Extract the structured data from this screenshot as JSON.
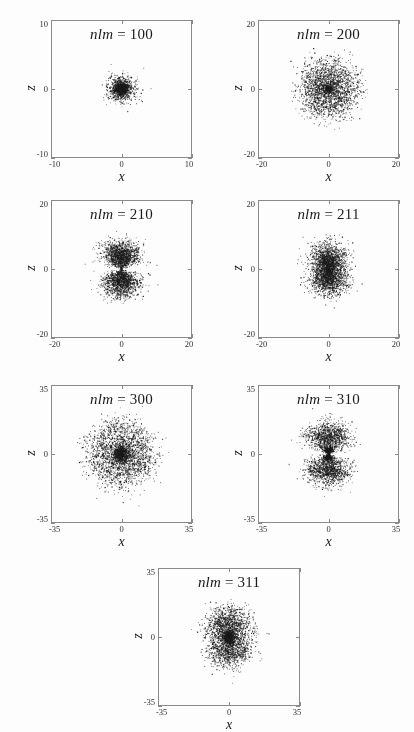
{
  "figure": {
    "background_color": "#fdfdfd",
    "frame_color": "#8a8a8a",
    "point_color": "#1a1a1a",
    "axis_label_x": "x",
    "axis_label_z": "z"
  },
  "chart_data": {
    "type": "scatter",
    "title": "",
    "xlabel": "x",
    "ylabel": "z",
    "grid": false,
    "legend": null,
    "panels": [
      {
        "id": "panel-100",
        "title_var": "nlm",
        "title_eq": "=",
        "title_value": "100",
        "title": "nlm = 100",
        "xlabel": "x",
        "ylabel": "z",
        "xlim": [
          -10,
          10
        ],
        "ylim": [
          -10,
          10
        ],
        "xticks": [
          -10,
          0,
          10
        ],
        "yticks": [
          -10,
          0,
          10
        ],
        "xtick_labels": [
          "-10",
          "0",
          "10"
        ],
        "ytick_labels": [
          "-10",
          "0",
          "10"
        ],
        "n_points": 2600,
        "shape": "sphere",
        "shells": [
          {
            "radius": 0.0,
            "spread": 1.35,
            "weight": 1.0
          }
        ],
        "lobe_axis": "none",
        "lobe_power": 0
      },
      {
        "id": "panel-200",
        "title_var": "nlm",
        "title_eq": "=",
        "title_value": "200",
        "title": "nlm = 200",
        "xlabel": "x",
        "ylabel": "z",
        "xlim": [
          -20,
          20
        ],
        "ylim": [
          -20,
          20
        ],
        "xticks": [
          -20,
          0,
          20
        ],
        "yticks": [
          -20,
          0,
          20
        ],
        "xtick_labels": [
          "-20",
          "0",
          "20"
        ],
        "ytick_labels": [
          "-20",
          "0",
          "20"
        ],
        "n_points": 2900,
        "shape": "sphere",
        "shells": [
          {
            "radius": 0.0,
            "spread": 1.1,
            "weight": 0.22
          },
          {
            "radius": 6.4,
            "spread": 2.5,
            "weight": 0.78
          }
        ],
        "lobe_axis": "none",
        "lobe_power": 0
      },
      {
        "id": "panel-210",
        "title_var": "nlm",
        "title_eq": "=",
        "title_value": "210",
        "title": "nlm = 210",
        "xlabel": "x",
        "ylabel": "z",
        "xlim": [
          -20,
          20
        ],
        "ylim": [
          -20,
          20
        ],
        "xticks": [
          -20,
          0,
          20
        ],
        "yticks": [
          -20,
          0,
          20
        ],
        "xtick_labels": [
          "-20",
          "0",
          "20"
        ],
        "ytick_labels": [
          "-20",
          "0",
          "20"
        ],
        "n_points": 2900,
        "shape": "lobes",
        "shells": [
          {
            "radius": 5.2,
            "spread": 2.1,
            "weight": 1.0
          }
        ],
        "lobe_axis": "z",
        "lobe_power": 2
      },
      {
        "id": "panel-211",
        "title_var": "nlm",
        "title_eq": "=",
        "title_value": "211",
        "title": "nlm = 211",
        "xlabel": "x",
        "ylabel": "z",
        "xlim": [
          -20,
          20
        ],
        "ylim": [
          -20,
          20
        ],
        "xticks": [
          -20,
          0,
          20
        ],
        "yticks": [
          -20,
          0,
          20
        ],
        "xtick_labels": [
          "-20",
          "0",
          "20"
        ],
        "ytick_labels": [
          "-20",
          "0",
          "20"
        ],
        "n_points": 2900,
        "shape": "lobes",
        "shells": [
          {
            "radius": 5.2,
            "spread": 2.1,
            "weight": 1.0
          }
        ],
        "lobe_axis": "x",
        "lobe_power": 2
      },
      {
        "id": "panel-300",
        "title_var": "nlm",
        "title_eq": "=",
        "title_value": "300",
        "title": "nlm = 300",
        "xlabel": "x",
        "ylabel": "z",
        "xlim": [
          -35,
          35
        ],
        "ylim": [
          -35,
          35
        ],
        "xticks": [
          -35,
          0,
          35
        ],
        "yticks": [
          -35,
          0,
          35
        ],
        "xtick_labels": [
          "-35",
          "0",
          "35"
        ],
        "ytick_labels": [
          "-35",
          "0",
          "35"
        ],
        "n_points": 3100,
        "shape": "sphere",
        "shells": [
          {
            "radius": 0.0,
            "spread": 1.0,
            "weight": 0.06
          },
          {
            "radius": 3.6,
            "spread": 1.2,
            "weight": 0.24
          },
          {
            "radius": 13.5,
            "spread": 4.2,
            "weight": 0.7
          }
        ],
        "lobe_axis": "none",
        "lobe_power": 0
      },
      {
        "id": "panel-310",
        "title_var": "nlm",
        "title_eq": "=",
        "title_value": "310",
        "title": "nlm = 310",
        "xlabel": "x",
        "ylabel": "z",
        "xlim": [
          -35,
          35
        ],
        "ylim": [
          -35,
          35
        ],
        "xticks": [
          -35,
          0,
          35
        ],
        "yticks": [
          -35,
          0,
          35
        ],
        "xtick_labels": [
          "-35",
          "0",
          "35"
        ],
        "ytick_labels": [
          "-35",
          "0",
          "35"
        ],
        "n_points": 3100,
        "shape": "lobes",
        "shells": [
          {
            "radius": 2.2,
            "spread": 1.3,
            "weight": 0.26
          },
          {
            "radius": 11.5,
            "spread": 3.6,
            "weight": 0.74
          }
        ],
        "lobe_axis": "z",
        "lobe_power": 2
      },
      {
        "id": "panel-311",
        "title_var": "nlm",
        "title_eq": "=",
        "title_value": "311",
        "title": "nlm = 311",
        "xlabel": "x",
        "ylabel": "z",
        "xlim": [
          -35,
          35
        ],
        "ylim": [
          -35,
          35
        ],
        "xticks": [
          -35,
          0,
          35
        ],
        "yticks": [
          -35,
          0,
          35
        ],
        "xtick_labels": [
          "-35",
          "0",
          "35"
        ],
        "ytick_labels": [
          "-35",
          "0",
          "35"
        ],
        "n_points": 3100,
        "shape": "lobes",
        "shells": [
          {
            "radius": 2.4,
            "spread": 1.2,
            "weight": 0.24
          },
          {
            "radius": 11.5,
            "spread": 3.6,
            "weight": 0.76
          }
        ],
        "lobe_axis": "x",
        "lobe_power": 2
      }
    ]
  },
  "layout": {
    "panel_boxes": [
      {
        "id": "panel-100",
        "left": 51,
        "top": 20,
        "width": 141,
        "height": 138
      },
      {
        "id": "panel-200",
        "left": 258,
        "top": 20,
        "width": 141,
        "height": 138
      },
      {
        "id": "panel-210",
        "left": 51,
        "top": 200,
        "width": 141,
        "height": 138
      },
      {
        "id": "panel-211",
        "left": 258,
        "top": 200,
        "width": 141,
        "height": 138
      },
      {
        "id": "panel-300",
        "left": 51,
        "top": 385,
        "width": 141,
        "height": 138
      },
      {
        "id": "panel-310",
        "left": 258,
        "top": 385,
        "width": 141,
        "height": 138
      },
      {
        "id": "panel-311",
        "left": 158,
        "top": 568,
        "width": 142,
        "height": 138
      }
    ]
  }
}
